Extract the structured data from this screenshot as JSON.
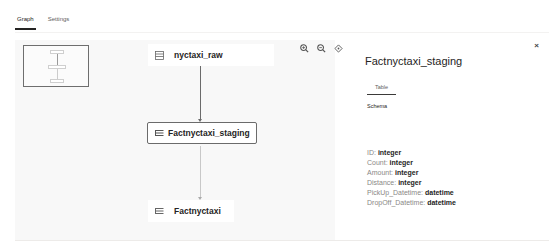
{
  "tabs": [
    {
      "label": "Graph",
      "active": true
    },
    {
      "label": "Settings",
      "active": false
    }
  ],
  "graph": {
    "nodes": [
      {
        "id": "nyctaxi_raw",
        "label": "nyctaxi_raw",
        "icon": "table-icon",
        "selected": false
      },
      {
        "id": "factnyctaxi_staging",
        "label": "Factnyctaxi_staging",
        "icon": "table-icon",
        "selected": true
      },
      {
        "id": "factnyctaxi",
        "label": "Factnyctaxi",
        "icon": "table-icon",
        "selected": false
      }
    ],
    "edges": [
      {
        "from": "nyctaxi_raw",
        "to": "factnyctaxi_staging",
        "color": "#6b6b6b"
      },
      {
        "from": "factnyctaxi_staging",
        "to": "factnyctaxi",
        "color": "#c8c8c8"
      }
    ],
    "zoom_controls": [
      {
        "name": "zoom-in",
        "glyph": "+"
      },
      {
        "name": "zoom-out",
        "glyph": "−"
      },
      {
        "name": "fit-to-view",
        "glyph": "◇"
      }
    ]
  },
  "panel": {
    "close_glyph": "×",
    "title": "Factnyctaxi_staging",
    "tab_label": "Table",
    "schema_label": "Schema",
    "fields": [
      {
        "name": "ID: ",
        "type": "integer"
      },
      {
        "name": "Count: ",
        "type": "integer"
      },
      {
        "name": "Amount: ",
        "type": "integer"
      },
      {
        "name": "Distance: ",
        "type": "integer"
      },
      {
        "name": "PickUp_Datetime: ",
        "type": "datetime"
      },
      {
        "name": "DropOff_Datetime: ",
        "type": "datetime"
      }
    ]
  },
  "colors": {
    "canvas_bg": "#f8f8f8",
    "active_tab_underline": "#252423",
    "selected_node_border": "#6b6b6b"
  }
}
